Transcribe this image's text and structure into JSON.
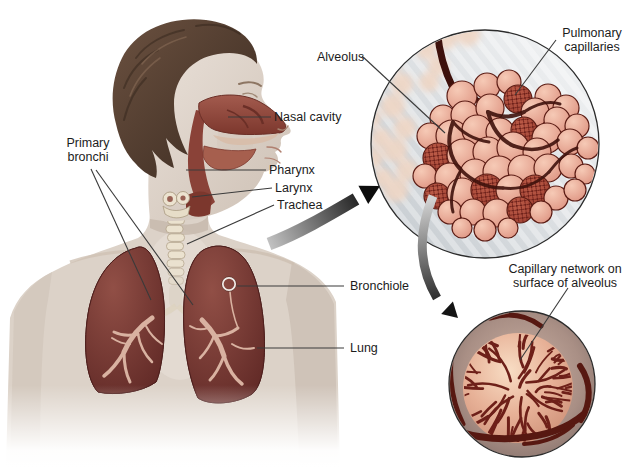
{
  "labels": {
    "nasal_cavity": "Nasal cavity",
    "pharynx": "Pharynx",
    "larynx": "Larynx",
    "trachea": "Trachea",
    "primary_bronchi": "Primary bronchi",
    "bronchiole": "Bronchiole",
    "lung": "Lung",
    "alveolus": "Alveolus",
    "pulmonary_capillaries": "Pulmonary capillaries",
    "capillary_network": "Capillary network on surface of alveolus"
  },
  "colors": {
    "lung": "#6f3130",
    "alveolus": "#e8a38e",
    "capillary_vessel": "#3d110c",
    "skin": "#dcd2c8",
    "hair": "#5d4636",
    "airway_red": "#9a5347",
    "inset_background": "#d3d8db",
    "leader_line": "#3a3a3a",
    "text": "#1c1c1c"
  }
}
